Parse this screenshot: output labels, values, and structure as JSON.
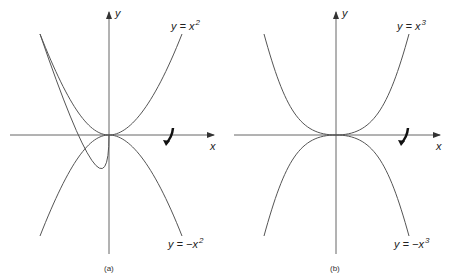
{
  "panels": [
    {
      "caption": "(a)",
      "x_axis_label": "x",
      "y_axis_label": "y",
      "upper_curve": {
        "prefix": "y = x",
        "exponent": "2"
      },
      "lower_curve": {
        "prefix": "y = −x",
        "exponent": "2"
      }
    },
    {
      "caption": "(b)",
      "x_axis_label": "x",
      "y_axis_label": "y",
      "upper_curve": {
        "prefix": "y = x",
        "exponent": "3"
      },
      "lower_curve": {
        "prefix": "y = −x",
        "exponent": "3"
      }
    }
  ],
  "colors": {
    "line": "#555555",
    "arrow": "#222222",
    "text": "#222222"
  }
}
